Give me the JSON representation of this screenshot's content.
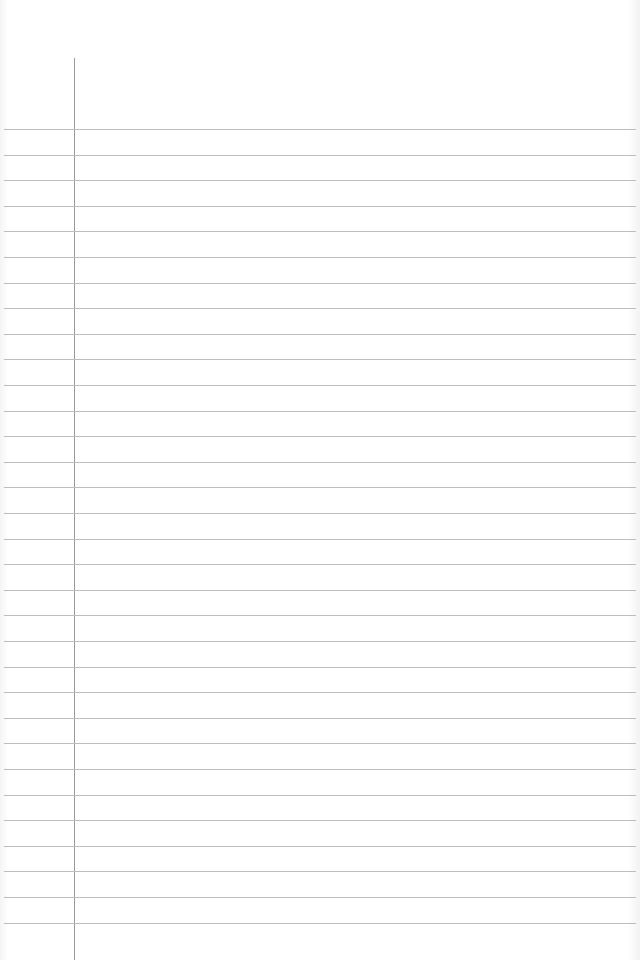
{
  "page": {
    "type": "lined-notebook-paper",
    "background_color": "#ffffff",
    "rule_color": "#bdbdbd",
    "margin_line_color": "#9a9a9a",
    "margin_line_x": 74,
    "margin_line_top": 58,
    "first_rule_y": 129,
    "rule_spacing": 25.6,
    "rule_count": 32
  }
}
